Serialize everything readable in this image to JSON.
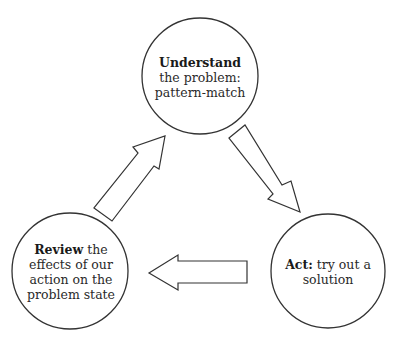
{
  "diagram": {
    "type": "cycle",
    "stroke_color": "#333333",
    "background": "#ffffff",
    "nodes": [
      {
        "id": "understand",
        "bold": "Understand",
        "lines": [
          "the problem:",
          "pattern-match"
        ],
        "center": [
          200,
          76
        ],
        "radius": 58
      },
      {
        "id": "act",
        "bold": "Act:",
        "lines": [
          "try out a",
          "solution"
        ],
        "center": [
          328,
          271
        ],
        "radius": 57
      },
      {
        "id": "review",
        "bold": "Review",
        "lines": [
          "the",
          "effects of our",
          "action on the",
          "problem state"
        ],
        "center": [
          70,
          271
        ],
        "radius": 58
      }
    ],
    "edges": [
      {
        "from": "understand",
        "to": "act",
        "direction": "down-right"
      },
      {
        "from": "act",
        "to": "review",
        "direction": "left"
      },
      {
        "from": "review",
        "to": "understand",
        "direction": "up-right"
      }
    ]
  }
}
